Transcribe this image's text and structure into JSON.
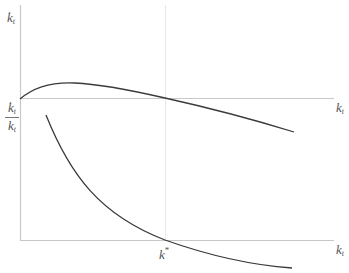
{
  "diagram": {
    "type": "economics-phase-diagram",
    "upper_panel": {
      "y_axis_label": {
        "base": "k",
        "dot": "·",
        "subscript": "t"
      },
      "x_axis_label": {
        "base": "k",
        "subscript": "t"
      }
    },
    "lower_panel": {
      "y_axis_label": {
        "numerator": {
          "base": "k",
          "dot": "·",
          "subscript": "t"
        },
        "denominator": {
          "base": "k",
          "subscript": "t"
        }
      },
      "x_axis_label": {
        "base": "k",
        "subscript": "t"
      },
      "steady_state_label": {
        "base": "k",
        "superscript": "*"
      }
    },
    "colors": {
      "axis": "#c8c8c8",
      "curve": "#3a3a3a",
      "guide": "#e4e4e4",
      "label": "#555555"
    }
  }
}
